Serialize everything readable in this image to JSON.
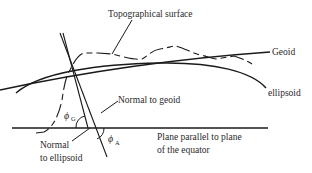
{
  "diagram": {
    "labels": {
      "topographical_surface": "Topographical surface",
      "geoid": "Geoid",
      "ellipsoid": "ellipsoid",
      "normal_to_geoid": "Normal to geoid",
      "normal_to_ellipsoid_line1": "Normal",
      "normal_to_ellipsoid_line2": "to ellipsoid",
      "plane_line1": "Plane parallel to plane",
      "plane_line2": "of the equator"
    },
    "symbols": {
      "phi_g": "ϕ",
      "phi_g_sub": "G",
      "phi_a": "ϕ",
      "phi_a_sub": "A"
    },
    "colors": {
      "stroke": "#1a1a1a",
      "text": "#2a2a2a",
      "background": "#ffffff"
    }
  }
}
